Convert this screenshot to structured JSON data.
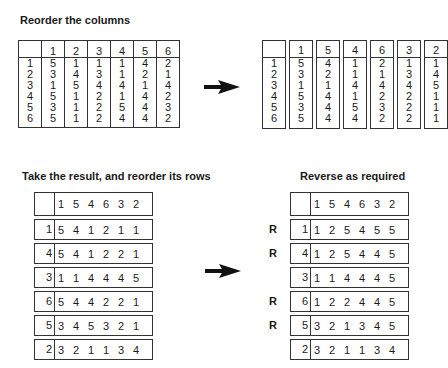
{
  "sections": {
    "top_left_title": "Reorder the columns",
    "bottom_left_title": "Take the result, and reorder its rows",
    "bottom_right_title": "Reverse as required"
  },
  "arrows": [
    "arrow-right",
    "arrow-right"
  ],
  "original_table": {
    "columns": [
      "",
      "1",
      "2",
      "3",
      "4",
      "5",
      "6"
    ],
    "rows": [
      [
        "1",
        "5",
        "1",
        "1",
        "1",
        "4",
        "2"
      ],
      [
        "2",
        "3",
        "4",
        "3",
        "1",
        "2",
        "1"
      ],
      [
        "3",
        "1",
        "5",
        "4",
        "4",
        "1",
        "4"
      ],
      [
        "4",
        "5",
        "1",
        "2",
        "1",
        "4",
        "2"
      ],
      [
        "5",
        "3",
        "1",
        "2",
        "5",
        "4",
        "3"
      ],
      [
        "6",
        "5",
        "1",
        "2",
        "4",
        "4",
        "2"
      ]
    ]
  },
  "reordered_columns_table": {
    "columns": [
      {
        "header": "",
        "cells": [
          "1",
          "2",
          "3",
          "4",
          "5",
          "6"
        ]
      },
      {
        "header": "1",
        "cells": [
          "5",
          "3",
          "1",
          "5",
          "3",
          "5"
        ]
      },
      {
        "header": "5",
        "cells": [
          "4",
          "2",
          "1",
          "4",
          "4",
          "4"
        ]
      },
      {
        "header": "4",
        "cells": [
          "1",
          "1",
          "4",
          "1",
          "5",
          "4"
        ]
      },
      {
        "header": "6",
        "cells": [
          "2",
          "1",
          "4",
          "2",
          "3",
          "2"
        ]
      },
      {
        "header": "3",
        "cells": [
          "1",
          "3",
          "4",
          "2",
          "2",
          "2"
        ]
      },
      {
        "header": "2",
        "cells": [
          "1",
          "4",
          "5",
          "1",
          "1",
          "1"
        ]
      }
    ]
  },
  "reordered_rows_table": {
    "header": {
      "key": "",
      "values": [
        "1",
        "5",
        "4",
        "6",
        "3",
        "2"
      ]
    },
    "rows": [
      {
        "key": "1",
        "values": [
          "5",
          "4",
          "1",
          "2",
          "1",
          "1"
        ]
      },
      {
        "key": "4",
        "values": [
          "5",
          "4",
          "1",
          "2",
          "2",
          "1"
        ]
      },
      {
        "key": "3",
        "values": [
          "1",
          "1",
          "4",
          "4",
          "4",
          "5"
        ]
      },
      {
        "key": "6",
        "values": [
          "5",
          "4",
          "4",
          "2",
          "2",
          "1"
        ]
      },
      {
        "key": "5",
        "values": [
          "3",
          "4",
          "5",
          "3",
          "2",
          "1"
        ]
      },
      {
        "key": "2",
        "values": [
          "3",
          "2",
          "1",
          "1",
          "3",
          "4"
        ]
      }
    ]
  },
  "reversed_table": {
    "header": {
      "key": "",
      "values": [
        "1",
        "5",
        "4",
        "6",
        "3",
        "2"
      ]
    },
    "rows": [
      {
        "mark": "R",
        "key": "1",
        "values": [
          "1",
          "2",
          "5",
          "4",
          "5",
          "5"
        ]
      },
      {
        "mark": "R",
        "key": "4",
        "values": [
          "1",
          "2",
          "5",
          "4",
          "4",
          "5"
        ]
      },
      {
        "mark": "",
        "key": "3",
        "values": [
          "1",
          "1",
          "4",
          "4",
          "4",
          "5"
        ]
      },
      {
        "mark": "R",
        "key": "6",
        "values": [
          "1",
          "2",
          "2",
          "4",
          "4",
          "5"
        ]
      },
      {
        "mark": "R",
        "key": "5",
        "values": [
          "3",
          "2",
          "1",
          "3",
          "4",
          "5"
        ]
      },
      {
        "mark": "",
        "key": "2",
        "values": [
          "3",
          "2",
          "1",
          "1",
          "3",
          "4"
        ]
      }
    ]
  }
}
